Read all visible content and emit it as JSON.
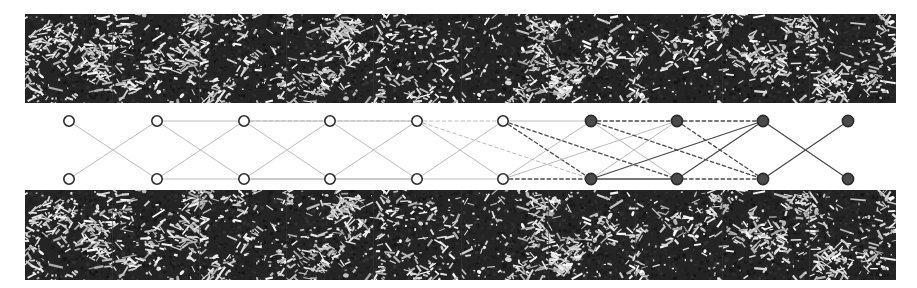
{
  "figure": {
    "caption": "",
    "canvas": {
      "width": 917,
      "height": 288
    },
    "background_color": "#ffffff"
  },
  "top_band": {
    "name": "top-texture-strip",
    "x": 25,
    "y": 14,
    "width": 871,
    "height": 89,
    "background_color": "#242424",
    "speckle_color": "#f2f2f2",
    "tile_count": 10,
    "seam_color": "#3b3b3b",
    "density": 0.085,
    "seed": 20117
  },
  "bottom_band": {
    "name": "bottom-texture-strip",
    "x": 25,
    "y": 190,
    "width": 871,
    "height": 90,
    "background_color": "#242424",
    "speckle_color": "#f2f2f2",
    "tile_count": 10,
    "seam_color": "#3b3b3b",
    "density": 0.085,
    "seed": 20117
  },
  "graph": {
    "name": "bipartite-correspondence-graph",
    "top_row_y": 121,
    "bottom_row_y": 179,
    "node_radius_open": 5.2,
    "node_radius_filled": 5.6,
    "open_fill": "#ffffff",
    "open_stroke": "#2b2b2b",
    "filled_fill": "#4a4a4a",
    "filled_stroke": "#2b2b2b",
    "node_stroke_width": 1.6,
    "edge_light_color": "#b4b4b4",
    "edge_dark_color": "#4a4a4a",
    "edge_width_light": 0.9,
    "edge_width_dark": 1.3,
    "dash_pattern": "3.5,2.8",
    "columns": [
      {
        "index": 1,
        "x": 69,
        "style": "open"
      },
      {
        "index": 2,
        "x": 157,
        "style": "open"
      },
      {
        "index": 3,
        "x": 244,
        "style": "open"
      },
      {
        "index": 4,
        "x": 330,
        "style": "open"
      },
      {
        "index": 5,
        "x": 417,
        "style": "open"
      },
      {
        "index": 6,
        "x": 503,
        "style": "open"
      },
      {
        "index": 7,
        "x": 591,
        "style": "filled"
      },
      {
        "index": 8,
        "x": 677,
        "style": "filled"
      },
      {
        "index": 9,
        "x": 763,
        "style": "filled"
      },
      {
        "index": 10,
        "x": 848,
        "style": "filled"
      }
    ],
    "edges": [
      {
        "from": [
          1,
          "top"
        ],
        "to": [
          2,
          "bottom"
        ],
        "style": "solid",
        "tone": "light"
      },
      {
        "from": [
          1,
          "bottom"
        ],
        "to": [
          2,
          "top"
        ],
        "style": "solid",
        "tone": "light"
      },
      {
        "from": [
          2,
          "top"
        ],
        "to": [
          3,
          "top"
        ],
        "style": "solid",
        "tone": "light"
      },
      {
        "from": [
          2,
          "top"
        ],
        "to": [
          3,
          "bottom"
        ],
        "style": "solid",
        "tone": "light"
      },
      {
        "from": [
          2,
          "bottom"
        ],
        "to": [
          3,
          "top"
        ],
        "style": "solid",
        "tone": "light"
      },
      {
        "from": [
          2,
          "bottom"
        ],
        "to": [
          3,
          "bottom"
        ],
        "style": "solid",
        "tone": "light"
      },
      {
        "from": [
          3,
          "top"
        ],
        "to": [
          4,
          "top"
        ],
        "style": "solid",
        "tone": "light"
      },
      {
        "from": [
          3,
          "top"
        ],
        "to": [
          4,
          "bottom"
        ],
        "style": "solid",
        "tone": "light"
      },
      {
        "from": [
          3,
          "bottom"
        ],
        "to": [
          4,
          "top"
        ],
        "style": "solid",
        "tone": "light"
      },
      {
        "from": [
          3,
          "bottom"
        ],
        "to": [
          4,
          "bottom"
        ],
        "style": "solid",
        "tone": "light"
      },
      {
        "from": [
          3,
          "top"
        ],
        "to": [
          5,
          "top"
        ],
        "style": "dashed",
        "tone": "light"
      },
      {
        "from": [
          3,
          "bottom"
        ],
        "to": [
          5,
          "bottom"
        ],
        "style": "solid",
        "tone": "light"
      },
      {
        "from": [
          4,
          "top"
        ],
        "to": [
          5,
          "top"
        ],
        "style": "solid",
        "tone": "light"
      },
      {
        "from": [
          4,
          "top"
        ],
        "to": [
          5,
          "bottom"
        ],
        "style": "solid",
        "tone": "light"
      },
      {
        "from": [
          4,
          "bottom"
        ],
        "to": [
          5,
          "top"
        ],
        "style": "solid",
        "tone": "light"
      },
      {
        "from": [
          4,
          "bottom"
        ],
        "to": [
          5,
          "bottom"
        ],
        "style": "solid",
        "tone": "light"
      },
      {
        "from": [
          5,
          "top"
        ],
        "to": [
          6,
          "top"
        ],
        "style": "dashed",
        "tone": "light"
      },
      {
        "from": [
          5,
          "top"
        ],
        "to": [
          6,
          "bottom"
        ],
        "style": "solid",
        "tone": "light"
      },
      {
        "from": [
          5,
          "bottom"
        ],
        "to": [
          6,
          "top"
        ],
        "style": "solid",
        "tone": "light"
      },
      {
        "from": [
          5,
          "bottom"
        ],
        "to": [
          6,
          "bottom"
        ],
        "style": "solid",
        "tone": "light"
      },
      {
        "from": [
          5,
          "top"
        ],
        "to": [
          7,
          "bottom"
        ],
        "style": "dashed",
        "tone": "light"
      },
      {
        "from": [
          6,
          "top"
        ],
        "to": [
          7,
          "top"
        ],
        "style": "solid",
        "tone": "light"
      },
      {
        "from": [
          6,
          "top"
        ],
        "to": [
          7,
          "bottom"
        ],
        "style": "dashed",
        "tone": "dark"
      },
      {
        "from": [
          6,
          "bottom"
        ],
        "to": [
          7,
          "top"
        ],
        "style": "solid",
        "tone": "light"
      },
      {
        "from": [
          6,
          "bottom"
        ],
        "to": [
          7,
          "bottom"
        ],
        "style": "dashed",
        "tone": "dark"
      },
      {
        "from": [
          6,
          "top"
        ],
        "to": [
          8,
          "bottom"
        ],
        "style": "dashed",
        "tone": "dark"
      },
      {
        "from": [
          6,
          "bottom"
        ],
        "to": [
          8,
          "top"
        ],
        "style": "solid",
        "tone": "light"
      },
      {
        "from": [
          7,
          "top"
        ],
        "to": [
          8,
          "top"
        ],
        "style": "dashed",
        "tone": "dark"
      },
      {
        "from": [
          7,
          "top"
        ],
        "to": [
          8,
          "bottom"
        ],
        "style": "solid",
        "tone": "light"
      },
      {
        "from": [
          7,
          "bottom"
        ],
        "to": [
          8,
          "top"
        ],
        "style": "solid",
        "tone": "light"
      },
      {
        "from": [
          7,
          "bottom"
        ],
        "to": [
          8,
          "bottom"
        ],
        "style": "solid",
        "tone": "dark"
      },
      {
        "from": [
          7,
          "top"
        ],
        "to": [
          9,
          "bottom"
        ],
        "style": "dashed",
        "tone": "dark"
      },
      {
        "from": [
          7,
          "bottom"
        ],
        "to": [
          9,
          "top"
        ],
        "style": "solid",
        "tone": "dark"
      },
      {
        "from": [
          8,
          "top"
        ],
        "to": [
          9,
          "top"
        ],
        "style": "dashed",
        "tone": "dark"
      },
      {
        "from": [
          8,
          "top"
        ],
        "to": [
          9,
          "bottom"
        ],
        "style": "dashed",
        "tone": "dark"
      },
      {
        "from": [
          8,
          "bottom"
        ],
        "to": [
          9,
          "top"
        ],
        "style": "solid",
        "tone": "dark"
      },
      {
        "from": [
          8,
          "bottom"
        ],
        "to": [
          9,
          "bottom"
        ],
        "style": "dashed",
        "tone": "dark"
      },
      {
        "from": [
          9,
          "top"
        ],
        "to": [
          10,
          "bottom"
        ],
        "style": "solid",
        "tone": "dark"
      },
      {
        "from": [
          9,
          "bottom"
        ],
        "to": [
          10,
          "top"
        ],
        "style": "solid",
        "tone": "dark"
      }
    ]
  }
}
